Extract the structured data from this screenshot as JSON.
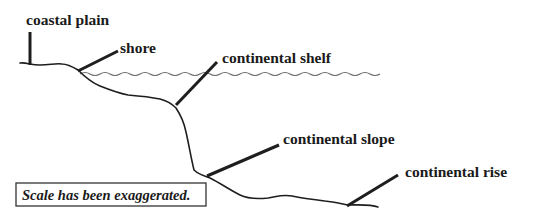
{
  "diagram": {
    "labels": {
      "coastal_plain": "coastal plain",
      "shore": "shore",
      "continental_shelf": "continental shelf",
      "continental_slope": "continental slope",
      "continental_rise": "continental rise"
    },
    "note": "Scale has been exaggerated.",
    "colors": {
      "line": "#1e1e1e",
      "water": "#6a6a6a",
      "text": "#1a1a1a",
      "background": "#ffffff"
    }
  }
}
